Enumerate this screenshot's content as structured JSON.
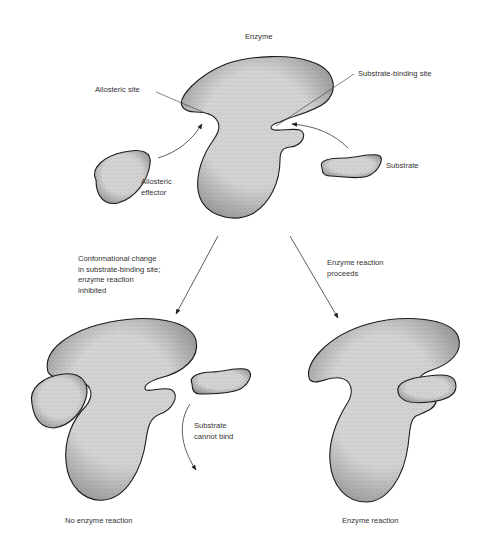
{
  "diagram": {
    "title": "Enzyme",
    "colors": {
      "background": "#ffffff",
      "blob_fill": "#d4d4d4",
      "outline": "#1e1e1e",
      "text": "#333333"
    },
    "top_panel": {
      "enzyme_label": "Enzyme",
      "labels": {
        "allosteric_site": "Allosteric site",
        "substrate_binding_site": "Substrate-binding site",
        "substrate": "Substrate",
        "allosteric_effector_line1": "Allosteric",
        "allosteric_effector_line2": "effector"
      }
    },
    "branches": {
      "left": {
        "arrow_caption_lines": [
          "Conformational change",
          "in substrate-binding site;",
          "enzyme reaction",
          "inhibited"
        ],
        "side_note_lines": [
          "Substrate",
          "cannot bind"
        ],
        "result_label": "No enzyme reaction"
      },
      "right": {
        "arrow_caption_lines": [
          "Enzyme reaction",
          "proceeds"
        ],
        "result_label": "Enzyme reaction"
      }
    }
  }
}
